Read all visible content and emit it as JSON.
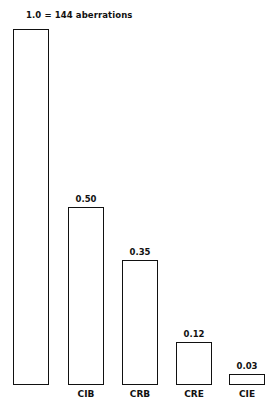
{
  "chart_data": {
    "type": "bar",
    "title": "1.0 = 144 aberrations",
    "categories": [
      "",
      "CIB",
      "CRB",
      "CRE",
      "CIE"
    ],
    "values": [
      1.0,
      0.5,
      0.35,
      0.12,
      0.03
    ],
    "value_labels": [
      "",
      "0.50",
      "0.35",
      "0.12",
      "0.03"
    ],
    "xlabel": "",
    "ylabel": "",
    "ylim": [
      0,
      1.0
    ],
    "grid": false,
    "legend": "none"
  },
  "title": "1.0  =  144  aberrations"
}
